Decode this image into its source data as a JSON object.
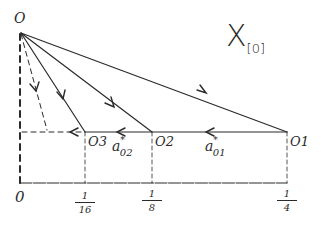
{
  "title": {
    "symbol": "X",
    "subscript": "[0]"
  },
  "origin": {
    "label": "O"
  },
  "points": [
    {
      "id": "O1",
      "label": "O1",
      "x_value": "1/4"
    },
    {
      "id": "O2",
      "label": "O2",
      "x_value": "1/8"
    },
    {
      "id": "O3",
      "label": "O3",
      "x_value": "1/16"
    }
  ],
  "edges": {
    "a01": {
      "base": "a",
      "sup": "*",
      "sub": "01"
    },
    "a02": {
      "base": "a",
      "sup": "*",
      "sub": "02"
    }
  },
  "axis": {
    "zero": "0",
    "ticks": [
      {
        "num": "1",
        "den": "16"
      },
      {
        "num": "1",
        "den": "8"
      },
      {
        "num": "1",
        "den": "4"
      }
    ]
  },
  "colors": {
    "ink": "#2a2a2a",
    "background": "#ffffff"
  }
}
